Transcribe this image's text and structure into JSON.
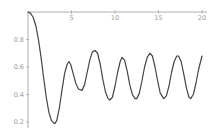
{
  "chart_data": {
    "type": "line",
    "title": "",
    "xlabel": "",
    "ylabel": "",
    "xlim": [
      0,
      20
    ],
    "ylim": [
      0.15,
      1.0
    ],
    "grid": false,
    "legend": null,
    "x_ticks": [
      5,
      10,
      15,
      20
    ],
    "x_tick_labels": [
      "5",
      "10",
      "15",
      "20"
    ],
    "y_ticks": [
      0.8,
      0.6,
      0.4,
      0.2
    ],
    "y_tick_labels": [
      "0.8",
      "0.6",
      "0.4",
      "0.2"
    ],
    "axis_origin": {
      "x": 0,
      "y": 1.0
    },
    "line_color": "#444444",
    "axis_color": "#999999",
    "series": [
      {
        "name": "curve",
        "x": [
          0,
          0.3,
          0.6,
          0.9,
          1.2,
          1.5,
          1.8,
          2.1,
          2.4,
          2.7,
          3.0,
          3.1,
          3.3,
          3.6,
          3.9,
          4.2,
          4.5,
          4.7,
          4.9,
          5.2,
          5.5,
          5.8,
          6.2,
          6.5,
          6.8,
          7.1,
          7.4,
          7.7,
          8.0,
          8.3,
          8.6,
          8.9,
          9.2,
          9.4,
          9.7,
          10.0,
          10.3,
          10.6,
          10.8,
          11.1,
          11.4,
          11.7,
          12.0,
          12.3,
          12.5,
          12.8,
          13.1,
          13.4,
          13.7,
          14.0,
          14.3,
          14.6,
          14.9,
          15.2,
          15.6,
          15.9,
          16.2,
          16.5,
          16.8,
          17.1,
          17.3,
          17.6,
          17.9,
          18.2,
          18.5,
          18.7,
          19.0,
          19.3,
          19.6,
          20.0
        ],
        "y": [
          1.0,
          0.99,
          0.96,
          0.9,
          0.8,
          0.67,
          0.52,
          0.38,
          0.27,
          0.21,
          0.19,
          0.19,
          0.21,
          0.3,
          0.43,
          0.55,
          0.62,
          0.64,
          0.62,
          0.55,
          0.48,
          0.44,
          0.43,
          0.47,
          0.56,
          0.65,
          0.71,
          0.72,
          0.7,
          0.62,
          0.51,
          0.42,
          0.37,
          0.36,
          0.38,
          0.46,
          0.56,
          0.64,
          0.67,
          0.65,
          0.57,
          0.47,
          0.4,
          0.37,
          0.37,
          0.41,
          0.5,
          0.6,
          0.67,
          0.7,
          0.68,
          0.6,
          0.5,
          0.41,
          0.37,
          0.39,
          0.46,
          0.56,
          0.64,
          0.68,
          0.68,
          0.64,
          0.55,
          0.45,
          0.38,
          0.37,
          0.4,
          0.48,
          0.58,
          0.68
        ]
      }
    ]
  }
}
